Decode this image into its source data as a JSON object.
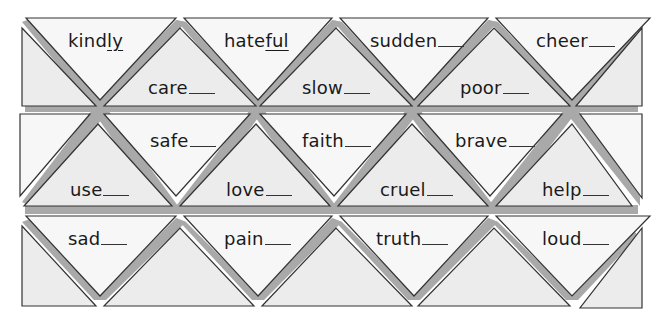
{
  "puzzle": {
    "row1": {
      "top": [
        {
          "stem": "kind",
          "suffix": "ly",
          "filled": true
        },
        {
          "stem": "hate",
          "suffix": "ful",
          "filled": true
        },
        {
          "stem": "sudden",
          "suffix": "",
          "filled": false
        },
        {
          "stem": "cheer",
          "suffix": "",
          "filled": false
        }
      ],
      "bottom": [
        {
          "stem": "care",
          "suffix": "",
          "filled": false
        },
        {
          "stem": "slow",
          "suffix": "",
          "filled": false
        },
        {
          "stem": "poor",
          "suffix": "",
          "filled": false
        }
      ]
    },
    "row2": {
      "top": [
        {
          "stem": "safe",
          "suffix": "",
          "filled": false
        },
        {
          "stem": "faith",
          "suffix": "",
          "filled": false
        },
        {
          "stem": "brave",
          "suffix": "",
          "filled": false
        }
      ],
      "bottom": [
        {
          "stem": "use",
          "suffix": "",
          "filled": false
        },
        {
          "stem": "love",
          "suffix": "",
          "filled": false
        },
        {
          "stem": "cruel",
          "suffix": "",
          "filled": false
        },
        {
          "stem": "help",
          "suffix": "",
          "filled": false
        }
      ]
    },
    "row3": {
      "top": [
        {
          "stem": "sad",
          "suffix": "",
          "filled": false
        },
        {
          "stem": "pain",
          "suffix": "",
          "filled": false
        },
        {
          "stem": "truth",
          "suffix": "",
          "filled": false
        },
        {
          "stem": "loud",
          "suffix": "",
          "filled": false
        }
      ]
    }
  },
  "colors": {
    "light_fill": "#f7f7f7",
    "dark_fill": "#ececec",
    "band": "#a9a9a9",
    "stroke": "#333333"
  }
}
